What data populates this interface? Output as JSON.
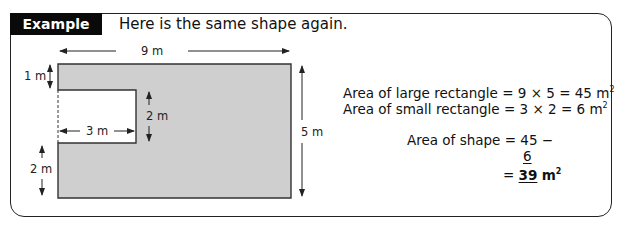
{
  "header": {
    "tag_label": "Example",
    "intro_text": "Here is the same shape again."
  },
  "diagram": {
    "fill_color": "#cfcfcf",
    "labels": {
      "width_top": "9 m",
      "top_gap": "1 m",
      "notch_height": "2 m",
      "notch_width": "3 m",
      "bottom_gap": "2 m",
      "height_right": "5 m"
    }
  },
  "working": {
    "large_rect": {
      "label": "Area of large rectangle",
      "expr": "= 9 × 5 = 45 m",
      "unit_power": "2"
    },
    "small_rect": {
      "label": "Area of small rectangle",
      "expr": "= 3 × 2 = 6 m",
      "unit_power": "2"
    },
    "shape": {
      "label": "Area of shape",
      "line1": "= 45 −",
      "line2": "6",
      "line3_prefix": "=",
      "result": "39",
      "result_unit": "m",
      "unit_power": "2"
    }
  }
}
